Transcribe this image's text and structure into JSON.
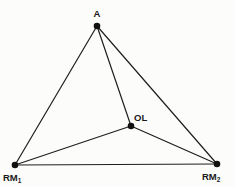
{
  "diagram": {
    "background_color": "#fcfcfa",
    "line_color": "#1f1f1f",
    "dot_color": "#111111",
    "label_color": "#1a1a1a",
    "dot_radius": 3.3,
    "line_width": 1.2,
    "width": 235,
    "height": 187,
    "nodes": [
      {
        "id": "A",
        "label": "A",
        "sub": "",
        "x": 97,
        "y": 26,
        "label_x": 97,
        "label_y": 17,
        "anchor": "middle"
      },
      {
        "id": "OL",
        "label": "OL",
        "sub": "",
        "x": 131,
        "y": 126,
        "label_x": 134,
        "label_y": 121,
        "anchor": "start"
      },
      {
        "id": "RM1",
        "label": "RM",
        "sub": "1",
        "x": 15,
        "y": 165,
        "label_x": 3,
        "label_y": 181,
        "anchor": "start"
      },
      {
        "id": "RM2",
        "label": "RM",
        "sub": "2",
        "x": 217,
        "y": 164,
        "label_x": 202,
        "label_y": 180,
        "anchor": "start"
      }
    ],
    "edges": [
      {
        "from": "A",
        "to": "RM1"
      },
      {
        "from": "A",
        "to": "RM2"
      },
      {
        "from": "A",
        "to": "OL"
      },
      {
        "from": "RM1",
        "to": "RM2"
      },
      {
        "from": "RM1",
        "to": "OL"
      },
      {
        "from": "RM2",
        "to": "OL"
      }
    ]
  }
}
